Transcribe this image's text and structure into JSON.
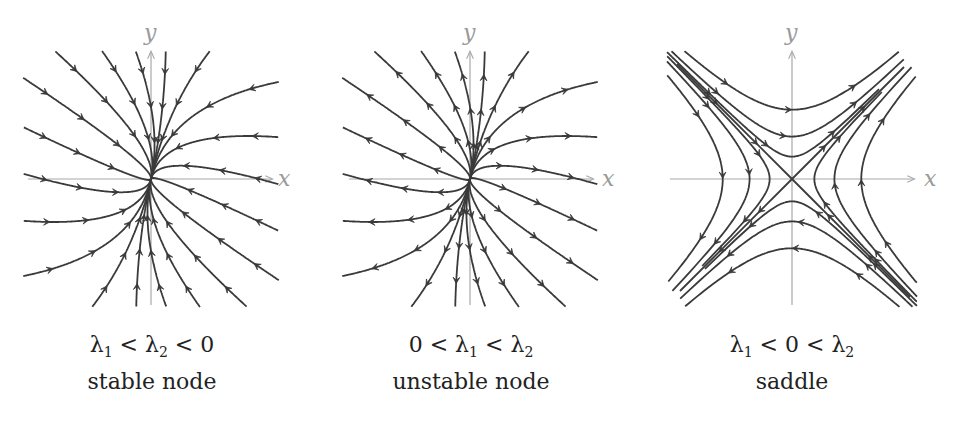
{
  "figure": {
    "panels": [
      {
        "id": "stable-node",
        "condition": {
          "parts": [
            "λ",
            "1",
            " < λ",
            "2",
            " < 0"
          ]
        },
        "condition_text": "λ1 < λ2 < 0",
        "name": "stable node",
        "axis_x_label": "x",
        "axis_y_label": "y",
        "flow_direction": "inward"
      },
      {
        "id": "unstable-node",
        "condition": {
          "parts": [
            "0 < λ",
            "1",
            " < λ",
            "2",
            ""
          ]
        },
        "condition_text": "0 < λ1 < λ2",
        "name": "unstable node",
        "axis_x_label": "x",
        "axis_y_label": "y",
        "flow_direction": "outward"
      },
      {
        "id": "saddle",
        "condition": {
          "parts": [
            "λ",
            "1",
            " < 0 < λ",
            "2",
            ""
          ]
        },
        "condition_text": "λ1 < 0 < λ2",
        "name": "saddle",
        "axis_x_label": "x",
        "axis_y_label": "y",
        "flow_direction": "saddle"
      }
    ],
    "colors": {
      "trajectory": "#3a3a3a",
      "axis": "#a8a8a8",
      "axis_label": "#9a9a9a",
      "text": "#222222"
    }
  }
}
